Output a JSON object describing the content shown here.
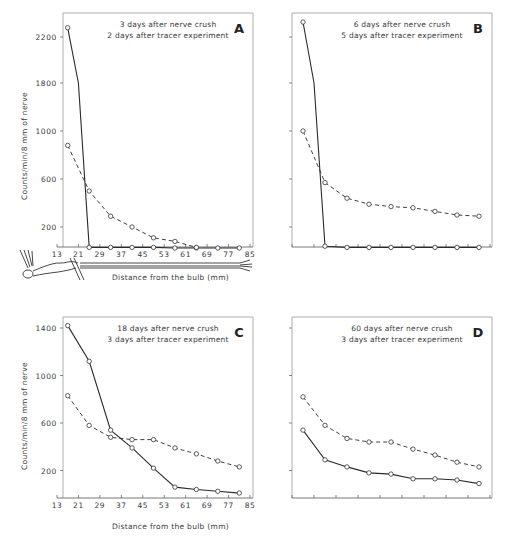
{
  "figure": {
    "y_axis_label": "Counts/min/8 mm of nerve",
    "x_axis_label": "Distance from the bulb (mm)"
  },
  "chart_data": [
    {
      "type": "line",
      "panel": "A",
      "title": "3 days after nerve crush",
      "subtitle": "2 days after tracer experiment",
      "xlabel": "Distance from the bulb (mm)",
      "ylabel": "Counts/min/8 mm of nerve",
      "x_ticks": [
        13,
        21,
        29,
        37,
        45,
        53,
        61,
        69,
        77,
        85
      ],
      "y_ticks": [
        200,
        600,
        1000,
        1800,
        2200
      ],
      "y_axis_broken": true,
      "xlim": [
        13,
        85
      ],
      "grid": false,
      "series": [
        {
          "name": "solid",
          "style": "solid",
          "x": [
            17,
            21,
            25,
            33,
            41,
            49,
            57,
            65,
            73,
            81
          ],
          "y": [
            2280,
            1800,
            30,
            30,
            30,
            30,
            25,
            25,
            25,
            25
          ],
          "markers": [
            true,
            false,
            true,
            true,
            true,
            true,
            true,
            true,
            true,
            true
          ]
        },
        {
          "name": "dashed",
          "style": "dashed",
          "x": [
            17,
            25,
            33,
            41,
            49,
            57,
            65
          ],
          "y": [
            880,
            500,
            290,
            200,
            110,
            80,
            30
          ]
        }
      ]
    },
    {
      "type": "line",
      "panel": "B",
      "title": "6 days after nerve crush",
      "subtitle": "5 days after tracer experiment",
      "xlim": [
        13,
        85
      ],
      "y_ticks": [
        200,
        600,
        1000,
        1800,
        2200
      ],
      "y_axis_broken": true,
      "grid": false,
      "series": [
        {
          "name": "solid",
          "style": "solid",
          "x": [
            17,
            21,
            25,
            33,
            41,
            49,
            57,
            65,
            73,
            81
          ],
          "y": [
            2330,
            1800,
            40,
            30,
            30,
            30,
            30,
            30,
            30,
            30
          ],
          "markers": [
            true,
            false,
            true,
            true,
            true,
            true,
            true,
            true,
            true,
            true
          ]
        },
        {
          "name": "dashed",
          "style": "dashed",
          "x": [
            17,
            25,
            33,
            41,
            49,
            57,
            65,
            73,
            81
          ],
          "y": [
            1000,
            570,
            440,
            390,
            370,
            360,
            330,
            300,
            290
          ]
        }
      ]
    },
    {
      "type": "line",
      "panel": "C",
      "title": "18 days after nerve crush",
      "subtitle": "3 days after tracer experiment",
      "xlabel": "Distance from the bulb (mm)",
      "ylabel": "Counts/min/8 mm of nerve",
      "x_ticks": [
        13,
        21,
        29,
        37,
        45,
        53,
        61,
        69,
        77,
        85
      ],
      "y_ticks": [
        200,
        600,
        1000,
        1400
      ],
      "xlim": [
        13,
        85
      ],
      "grid": false,
      "series": [
        {
          "name": "solid",
          "style": "solid",
          "x": [
            17,
            25,
            33,
            41,
            49,
            57,
            65,
            73,
            81
          ],
          "y": [
            1420,
            1120,
            540,
            390,
            220,
            60,
            40,
            25,
            10
          ]
        },
        {
          "name": "dashed",
          "style": "dashed",
          "x": [
            17,
            25,
            33,
            41,
            49,
            57,
            65,
            73,
            81
          ],
          "y": [
            830,
            580,
            480,
            460,
            460,
            390,
            340,
            280,
            230
          ]
        }
      ]
    },
    {
      "type": "line",
      "panel": "D",
      "title": "60 days after nerve crush",
      "subtitle": "3 days after tracer experiment",
      "xlim": [
        13,
        85
      ],
      "y_ticks": [
        200,
        600,
        1000,
        1400
      ],
      "grid": false,
      "series": [
        {
          "name": "solid",
          "style": "solid",
          "x": [
            17,
            25,
            33,
            41,
            49,
            57,
            65,
            73,
            81
          ],
          "y": [
            540,
            290,
            230,
            180,
            170,
            130,
            130,
            120,
            90
          ]
        },
        {
          "name": "dashed",
          "style": "dashed",
          "x": [
            17,
            25,
            33,
            41,
            49,
            57,
            65,
            73,
            81
          ],
          "y": [
            820,
            580,
            470,
            440,
            440,
            380,
            330,
            270,
            230
          ]
        }
      ]
    }
  ]
}
